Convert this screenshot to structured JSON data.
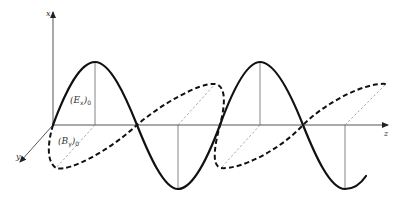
{
  "axes": {
    "x_label": "x",
    "y_label": "y",
    "z_label": "z"
  },
  "waves": [
    {
      "name": "E field",
      "style": "solid",
      "plane": "x-z",
      "label_main": "(E",
      "label_sub": "x",
      "label_close": ")",
      "label_zero": "0"
    },
    {
      "name": "B field",
      "style": "dashed",
      "plane": "y-z",
      "label_main": "(B",
      "label_sub": "y",
      "label_close": ")",
      "label_zero": "0"
    }
  ],
  "colors": {
    "curve": "#111111",
    "axis": "#555555",
    "background": "#ffffff"
  }
}
